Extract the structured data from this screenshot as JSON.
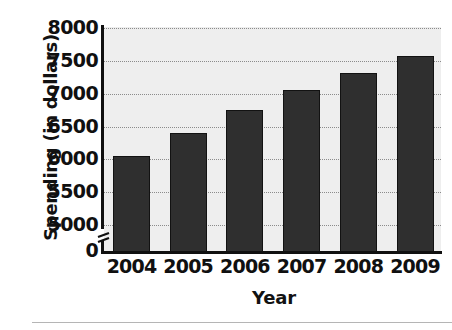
{
  "chart_data": {
    "type": "bar",
    "title": "",
    "xlabel": "Year",
    "ylabel": "Spending (in dollars)",
    "categories": [
      "2004",
      "2005",
      "2006",
      "2007",
      "2008",
      "2009"
    ],
    "values": [
      6050,
      6400,
      6750,
      7060,
      7320,
      7570
    ],
    "ylim": [
      5000,
      8000
    ],
    "y_axis_break": true,
    "y_break_label": "0",
    "y_ticks": [
      8000,
      7500,
      7000,
      6500,
      6000,
      5500,
      5000,
      0
    ],
    "y_tick_labels": [
      "8000",
      "7500",
      "7000",
      "6500",
      "6000",
      "5500",
      "5000",
      "0"
    ],
    "grid": true,
    "grid_style": "dotted-horizontal",
    "legend": "none",
    "bar_color": "#2f2f2f",
    "bar_edge_color": "#121212",
    "plot_background": "#eeeeee",
    "axis_color": "#101010",
    "gridline_color": "#8b8b8b"
  }
}
